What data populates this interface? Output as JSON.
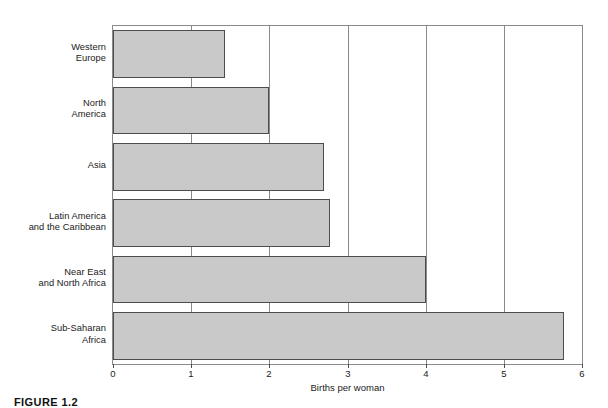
{
  "chart_data": {
    "type": "bar",
    "orientation": "horizontal",
    "title": "",
    "xlabel": "Births per woman",
    "ylabel": "",
    "xlim": [
      0,
      6
    ],
    "xticks": [
      "0",
      "1",
      "2",
      "3",
      "4",
      "5",
      "6"
    ],
    "grid": "vertical gridlines at 1,2,3,4,5",
    "legend": "none",
    "categories": [
      "Western Europe",
      "North America",
      "Asia",
      "Latin America and the Caribbean",
      "Near East and North Africa",
      "Sub-Saharan Africa"
    ],
    "category_lines": [
      [
        "Western",
        "Europe"
      ],
      [
        "North",
        "America"
      ],
      [
        "Asia"
      ],
      [
        "Latin America",
        "and the Caribbean"
      ],
      [
        "Near East",
        "and North Africa"
      ],
      [
        "Sub-Saharan",
        "Africa"
      ]
    ],
    "values": [
      1.43,
      2.0,
      2.7,
      2.77,
      4.0,
      5.77
    ],
    "bar_fill": "#c9c9c9",
    "bar_border": "#4d4d4d",
    "axis_color": "#8a8a8a"
  },
  "caption": {
    "label": "FIGURE 1.2"
  }
}
